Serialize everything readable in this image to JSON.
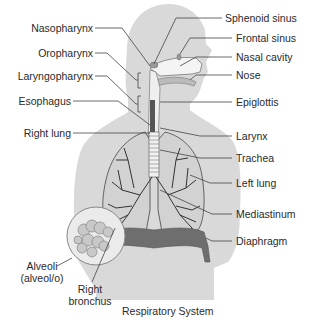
{
  "diagram": {
    "title": "Respiratory System",
    "colors": {
      "body_fill": "#d9d9d9",
      "lung_outline": "#555555",
      "bronchi": "#333333",
      "diaphragm": "#6e6e6e",
      "leader_line": "#444444",
      "text": "#2a2a2a"
    },
    "labels_left": [
      {
        "id": "nasopharynx",
        "text": "Nasopharynx"
      },
      {
        "id": "oropharynx",
        "text": "Oropharynx"
      },
      {
        "id": "laryngopharynx",
        "text": "Laryngopharynx"
      },
      {
        "id": "esophagus",
        "text": "Esophagus"
      },
      {
        "id": "right-lung",
        "text": "Right lung"
      }
    ],
    "labels_right": [
      {
        "id": "sphenoid-sinus",
        "text": "Sphenoid sinus"
      },
      {
        "id": "frontal-sinus",
        "text": "Frontal sinus"
      },
      {
        "id": "nasal-cavity",
        "text": "Nasal cavity"
      },
      {
        "id": "nose",
        "text": "Nose"
      },
      {
        "id": "epiglottis",
        "text": "Epiglottis"
      },
      {
        "id": "larynx",
        "text": "Larynx"
      },
      {
        "id": "trachea",
        "text": "Trachea"
      },
      {
        "id": "left-lung",
        "text": "Left lung"
      },
      {
        "id": "mediastinum",
        "text": "Mediastinum"
      },
      {
        "id": "diaphragm",
        "text": "Diaphragm"
      }
    ],
    "labels_bottom": [
      {
        "id": "alveoli",
        "line1": "Alveoli",
        "line2": "(alveol/o)"
      },
      {
        "id": "right-bronchus",
        "line1": "Right",
        "line2": "bronchus"
      }
    ]
  }
}
